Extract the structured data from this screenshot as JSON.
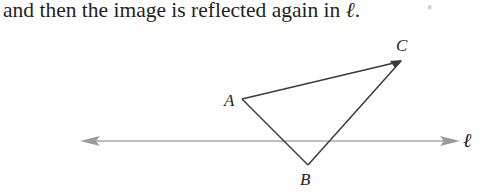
{
  "text": {
    "sentence_start": "and then the image is reflected again in ",
    "line_symbol": "ℓ",
    "sentence_end": ".",
    "marker": "*"
  },
  "figure": {
    "vertices": {
      "A": {
        "label": "A",
        "x": 242,
        "y": 99
      },
      "B": {
        "label": "B",
        "x": 308,
        "y": 165
      },
      "C": {
        "label": "C",
        "x": 401,
        "y": 61
      }
    },
    "line": {
      "label": "ℓ",
      "x1": 80,
      "x2": 460,
      "y": 141,
      "color": "#a0a0a0"
    },
    "triangle_color": "#3a3a3a"
  }
}
